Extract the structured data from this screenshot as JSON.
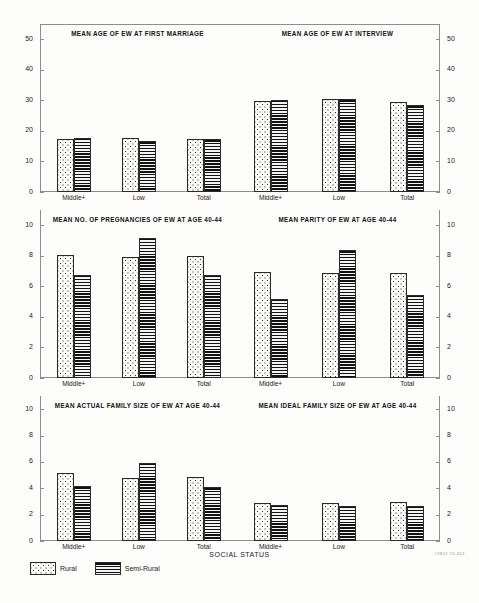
{
  "figure": {
    "axis_caption": "SOCIAL STATUS",
    "figure_code": "#3801  74-461",
    "categories": [
      "Middle+",
      "Low",
      "Total"
    ],
    "series_names": [
      "Rural",
      "Semi-Rural"
    ]
  },
  "legend": {
    "position": "bottom-left",
    "items": [
      {
        "label": "Rural",
        "pattern": "dotted",
        "color": "#fbfbf8"
      },
      {
        "label": "Semi-Rural",
        "pattern": "horizontal-lines",
        "color": "#2f2f2f"
      }
    ]
  },
  "chart_data": [
    {
      "type": "bar",
      "panel": "top-left",
      "title": "MEAN AGE OF EW AT FIRST MARRIAGE",
      "xlabel": "SOCIAL STATUS",
      "ylabel": "",
      "categories": [
        "Middle+",
        "Low",
        "Total"
      ],
      "series": [
        {
          "name": "Rural",
          "values": [
            17.2,
            17.6,
            17.5
          ]
        },
        {
          "name": "Semi-Rural",
          "values": [
            17.8,
            16.6,
            17.4
          ]
        }
      ],
      "ylim": [
        0,
        55
      ],
      "yticks": [
        0,
        10,
        20,
        30,
        40,
        50
      ],
      "axis_side": "left",
      "grid": false
    },
    {
      "type": "bar",
      "panel": "top-right",
      "title": "MEAN AGE OF EW AT INTERVIEW",
      "xlabel": "SOCIAL STATUS",
      "ylabel": "",
      "categories": [
        "Middle+",
        "Low",
        "Total"
      ],
      "series": [
        {
          "name": "Rural",
          "values": [
            29.9,
            30.3,
            29.6
          ]
        },
        {
          "name": "Semi-Rural",
          "values": [
            30.0,
            30.4,
            28.4
          ]
        }
      ],
      "ylim": [
        0,
        55
      ],
      "yticks": [
        0,
        10,
        20,
        30,
        40,
        50
      ],
      "axis_side": "right",
      "grid": false
    },
    {
      "type": "bar",
      "panel": "middle-left",
      "title": "MEAN NO. OF PREGNANCIES OF EW AT AGE 40-44",
      "xlabel": "SOCIAL STATUS",
      "ylabel": "",
      "categories": [
        "Middle+",
        "Low",
        "Total"
      ],
      "series": [
        {
          "name": "Rural",
          "values": [
            8.05,
            7.9,
            8.0
          ]
        },
        {
          "name": "Semi-Rural",
          "values": [
            6.75,
            9.2,
            6.75
          ]
        }
      ],
      "ylim": [
        0,
        11
      ],
      "yticks": [
        0,
        2,
        4,
        6,
        8,
        10
      ],
      "axis_side": "left",
      "grid": false
    },
    {
      "type": "bar",
      "panel": "middle-right",
      "title": "MEAN PARITY OF EW AT AGE 40-44",
      "xlabel": "SOCIAL STATUS",
      "ylabel": "",
      "categories": [
        "Middle+",
        "Low",
        "Total"
      ],
      "series": [
        {
          "name": "Rural",
          "values": [
            6.95,
            6.9,
            6.9
          ]
        },
        {
          "name": "Semi-Rural",
          "values": [
            5.2,
            8.35,
            5.45
          ]
        }
      ],
      "ylim": [
        0,
        11
      ],
      "yticks": [
        0,
        2,
        4,
        6,
        8,
        10
      ],
      "axis_side": "right",
      "grid": false
    },
    {
      "type": "bar",
      "panel": "bottom-left",
      "title": "MEAN ACTUAL FAMILY SIZE OF EW AT AGE 40-44",
      "xlabel": "SOCIAL STATUS",
      "ylabel": "",
      "categories": [
        "Middle+",
        "Low",
        "Total"
      ],
      "series": [
        {
          "name": "Rural",
          "values": [
            5.15,
            4.8,
            4.85
          ]
        },
        {
          "name": "Semi-Rural",
          "values": [
            4.15,
            5.9,
            4.1
          ]
        }
      ],
      "ylim": [
        0,
        11
      ],
      "yticks": [
        0,
        2,
        4,
        6,
        8,
        10
      ],
      "axis_side": "left",
      "grid": false
    },
    {
      "type": "bar",
      "panel": "bottom-right",
      "title": "MEAN IDEAL FAMILY SIZE OF  EW AT  AGE 40-44",
      "xlabel": "SOCIAL STATUS",
      "ylabel": "",
      "categories": [
        "Middle+",
        "Low",
        "Total"
      ],
      "series": [
        {
          "name": "Rural",
          "values": [
            2.9,
            2.85,
            2.95
          ]
        },
        {
          "name": "Semi-Rural",
          "values": [
            2.7,
            2.65,
            2.65
          ]
        }
      ],
      "ylim": [
        0,
        11
      ],
      "yticks": [
        0,
        2,
        4,
        6,
        8,
        10
      ],
      "axis_side": "right",
      "grid": false
    }
  ]
}
